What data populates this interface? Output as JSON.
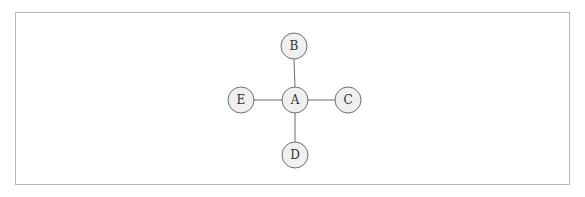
{
  "diagram": {
    "type": "graph",
    "layout": "star",
    "center_node": "A",
    "nodes": [
      {
        "id": "A",
        "label": "A",
        "x": 295,
        "y": 100
      },
      {
        "id": "B",
        "label": "B",
        "x": 294,
        "y": 46
      },
      {
        "id": "C",
        "label": "C",
        "x": 348,
        "y": 100
      },
      {
        "id": "D",
        "label": "D",
        "x": 295,
        "y": 155
      },
      {
        "id": "E",
        "label": "E",
        "x": 241,
        "y": 100
      }
    ],
    "edges": [
      {
        "from": "A",
        "to": "B"
      },
      {
        "from": "A",
        "to": "C"
      },
      {
        "from": "A",
        "to": "D"
      },
      {
        "from": "A",
        "to": "E"
      }
    ],
    "node_radius": 13,
    "colors": {
      "node_fill": "#f0f0f0",
      "node_stroke": "#6e6e6e",
      "edge": "#6a6a6a",
      "frame": "#b8b8b8"
    }
  }
}
